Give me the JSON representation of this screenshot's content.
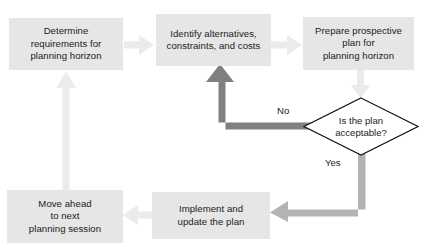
{
  "diagram": {
    "colors": {
      "box_fill": "#e6e6e6",
      "text": "#1b1b1b",
      "arrow_dark": "#808080",
      "arrow_medium": "#b3b3b3",
      "arrow_light": "#ebebeb",
      "diamond_outline": "#1b1b1b",
      "background": "#ffffff"
    },
    "nodes": [
      {
        "id": "determine-requirements",
        "shape": "process",
        "text": "Determine\nrequirements for\nplanning horizon"
      },
      {
        "id": "identify-alternatives",
        "shape": "process",
        "text": "Identify alternatives,\nconstraints, and costs"
      },
      {
        "id": "prepare-plan",
        "shape": "process",
        "text": "Prepare prospective\nplan for\nplanning horizon"
      },
      {
        "id": "is-plan-acceptable",
        "shape": "decision",
        "text": "Is the plan\nacceptable?"
      },
      {
        "id": "implement-update-plan",
        "shape": "process",
        "text": "Implement and\nupdate the plan"
      },
      {
        "id": "move-ahead",
        "shape": "process",
        "text": "Move ahead\nto next\nplanning session"
      }
    ],
    "edges": [
      {
        "id": "determine-to-identify",
        "from": "determine-requirements",
        "to": "identify-alternatives",
        "label": ""
      },
      {
        "id": "identify-to-prepare",
        "from": "identify-alternatives",
        "to": "prepare-plan",
        "label": ""
      },
      {
        "id": "prepare-to-decision",
        "from": "prepare-plan",
        "to": "is-plan-acceptable",
        "label": ""
      },
      {
        "id": "decision-no-to-identify",
        "from": "is-plan-acceptable",
        "to": "identify-alternatives",
        "label": "No"
      },
      {
        "id": "decision-yes-to-implement",
        "from": "is-plan-acceptable",
        "to": "implement-update-plan",
        "label": "Yes"
      },
      {
        "id": "implement-to-move-ahead",
        "from": "implement-update-plan",
        "to": "move-ahead",
        "label": ""
      },
      {
        "id": "move-ahead-to-determine",
        "from": "move-ahead",
        "to": "determine-requirements",
        "label": ""
      }
    ],
    "labels": {
      "no": "No",
      "yes": "Yes"
    }
  }
}
